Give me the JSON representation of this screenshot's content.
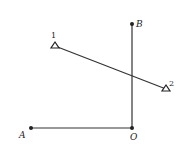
{
  "diagram": {
    "points": {
      "A": {
        "label": "A",
        "x": 31,
        "y": 128
      },
      "O": {
        "label": "O",
        "x": 132,
        "y": 128
      },
      "B": {
        "label": "B",
        "x": 132,
        "y": 24
      }
    },
    "markers": {
      "m1": {
        "label": "1",
        "x": 55,
        "y": 46
      },
      "m2": {
        "label": "2",
        "x": 166,
        "y": 89
      }
    },
    "line_color": "#333333"
  }
}
